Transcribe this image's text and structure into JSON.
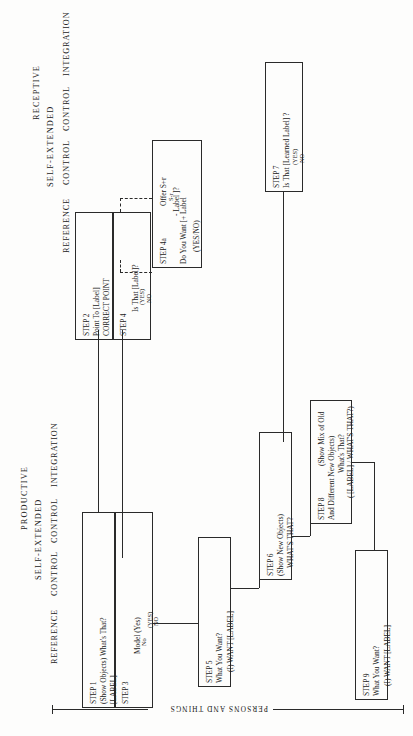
{
  "figure": {
    "orientation": "rotated-90-ccw",
    "axis_label": "PERSONS AND THINGS",
    "ink_color": "#2a2a2a",
    "paper_color": "#fdfdfc"
  },
  "groups": {
    "receptive": "RECEPTIVE",
    "productive": "PRODUCTIVE",
    "self_extended_top": "SELF-EXTENDED",
    "self_extended_bottom": "SELF-EXTENDED"
  },
  "column_headers": {
    "receptive": [
      "REFERENCE",
      "CONTROL",
      "CONTROL",
      "INTEGRATION"
    ],
    "productive": [
      "REFERENCE",
      "CONTROL",
      "CONTROL",
      "INTEGRATION"
    ]
  },
  "boxes": {
    "step2": {
      "step": "STEP 2",
      "line1": "Point To [Label]",
      "line2": "CORRECT POINT"
    },
    "step4": {
      "step": "STEP 4",
      "line1": "Is That [Label]?",
      "line2": "(YES)",
      "line3": "NO"
    },
    "step4a": {
      "step": "STEP 4a",
      "line1": "Offer S+r",
      "line2": "S-r",
      "line3": "Do You Want [+ Label",
      "line4": "- Label ]?",
      "line5": "(YES/NO)"
    },
    "step7": {
      "step": "STEP 7",
      "line1": "Is That [Learned Label] ?",
      "line2": "(YES)",
      "line3": "NO"
    },
    "step1": {
      "step": "STEP 1",
      "line1": "(Show Objects)  What's That?",
      "line2": "[LABEL]"
    },
    "step3": {
      "step": "STEP 3",
      "line1": "Model (Yes)",
      "line2": "No",
      "line3": "(YES)",
      "line4": "NO"
    },
    "step5": {
      "step": "STEP 5",
      "line1": "What You Want?",
      "line2": "(I) WANT [LABEL]"
    },
    "step6": {
      "step": "STEP 6",
      "line1": "(Show New Objects)",
      "line2": "WHAT'S THAT?"
    },
    "step8": {
      "step": "STEP 8",
      "line1": "(Show Mix of Old",
      "line2": "And Different New Objects)",
      "line3": "What's That?",
      "line4": "( [LABEL] / WHAT'S THAT?)"
    },
    "step9": {
      "step": "STEP 9",
      "line1": "What You Want?",
      "line2": "(I) WANT [LABEL]"
    }
  }
}
